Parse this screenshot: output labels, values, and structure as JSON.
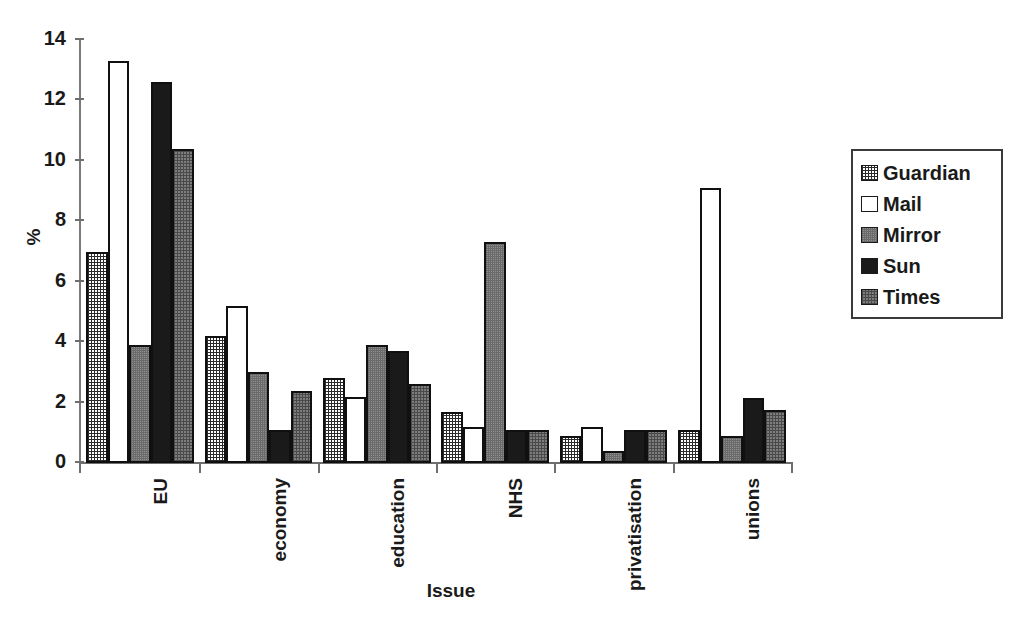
{
  "chart_data": {
    "type": "bar",
    "title": "",
    "xlabel": "Issue",
    "ylabel": "%",
    "ylim": [
      0,
      14
    ],
    "yticks": [
      0,
      2,
      4,
      6,
      8,
      10,
      12,
      14
    ],
    "grid": false,
    "legend_position": "right",
    "categories": [
      "EU",
      "economy",
      "education",
      "NHS",
      "privatisation",
      "unions"
    ],
    "series": [
      {
        "name": "Guardian",
        "fill": "fine-crosshatch",
        "color": "#ffffff",
        "values": [
          7.0,
          4.2,
          2.8,
          1.7,
          0.9,
          1.1
        ]
      },
      {
        "name": "Mail",
        "fill": "empty-white",
        "color": "#ffffff",
        "values": [
          13.3,
          5.2,
          2.2,
          1.2,
          1.2,
          9.1
        ]
      },
      {
        "name": "Mirror",
        "fill": "medium-grey",
        "color": "#8f8f8f",
        "values": [
          3.9,
          3.0,
          3.9,
          7.3,
          0.4,
          0.9
        ]
      },
      {
        "name": "Sun",
        "fill": "solid-black",
        "color": "#1a1a1a",
        "values": [
          12.6,
          1.1,
          3.7,
          1.1,
          1.1,
          2.15
        ]
      },
      {
        "name": "Times",
        "fill": "dark-grey-dither",
        "color": "#7d7d7d",
        "values": [
          10.4,
          2.4,
          2.6,
          1.1,
          1.1,
          1.75
        ]
      }
    ]
  },
  "legend": {
    "items": [
      {
        "label": "Guardian",
        "swatch": "swatch-guardian"
      },
      {
        "label": "Mail",
        "swatch": "swatch-mail"
      },
      {
        "label": "Mirror",
        "swatch": "swatch-mirror"
      },
      {
        "label": "Sun",
        "swatch": "swatch-sun"
      },
      {
        "label": "Times",
        "swatch": "swatch-times"
      }
    ]
  },
  "axes": {
    "y_label": "%",
    "x_label": "Issue",
    "y_tick_labels": [
      "14",
      "12",
      "10",
      "8",
      "6",
      "4",
      "2",
      "0"
    ],
    "x_tick_labels": [
      "EU",
      "economy",
      "education",
      "NHS",
      "privatisation",
      "unions"
    ]
  }
}
